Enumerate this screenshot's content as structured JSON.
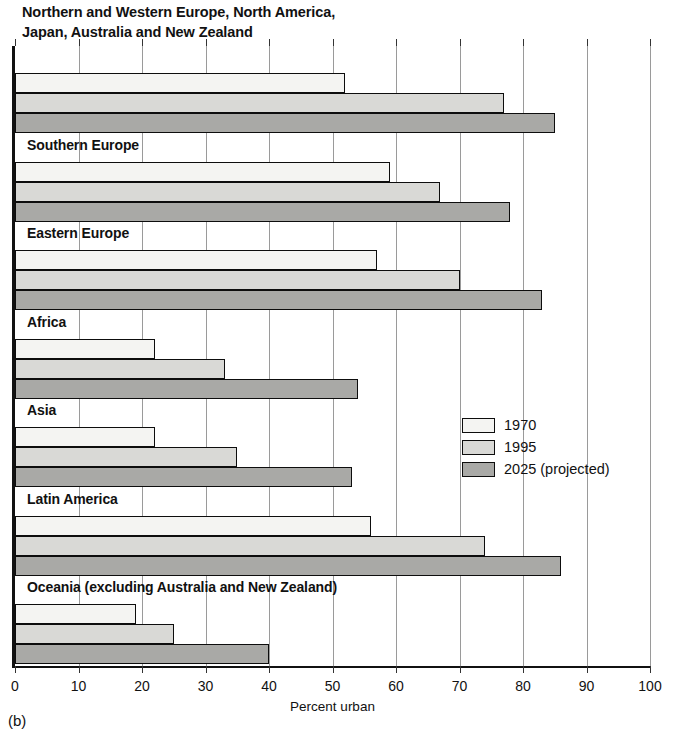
{
  "chart_data": {
    "type": "bar",
    "orientation": "horizontal",
    "title": "Northern and Western Europe, North America,\n Japan, Australia and New Zealand",
    "xlabel": "Percent urban",
    "ylabel": "",
    "xlim": [
      0,
      100
    ],
    "xticks": [
      0,
      10,
      20,
      30,
      40,
      50,
      60,
      70,
      80,
      90,
      100
    ],
    "grid": true,
    "legend_position": "middle-right",
    "categories": [
      "Northern and Western Europe, North America, Japan, Australia and New Zealand",
      "Southern Europe",
      "Eastern Europe",
      "Africa",
      "Asia",
      "Latin America",
      "Oceania (excluding Australia and New Zealand)"
    ],
    "series": [
      {
        "name": "1970",
        "color": "#f4f4f2",
        "values": [
          52,
          59,
          57,
          22,
          22,
          56,
          19
        ]
      },
      {
        "name": "1995",
        "color": "#d9d9d6",
        "values": [
          77,
          67,
          70,
          33,
          35,
          74,
          25
        ]
      },
      {
        "name": "2025 (projected)",
        "color": "#a9a9a6",
        "values": [
          85,
          78,
          83,
          54,
          53,
          86,
          40
        ]
      }
    ]
  },
  "groups": [
    {
      "label": "Northern and Western Europe, North America,\n Japan, Australia and New Zealand",
      "label_in_plot": false,
      "bars": [
        52,
        77,
        85
      ]
    },
    {
      "label": "Southern Europe",
      "label_in_plot": true,
      "bars": [
        59,
        67,
        78
      ]
    },
    {
      "label": "Eastern Europe",
      "label_in_plot": true,
      "bars": [
        57,
        70,
        83
      ]
    },
    {
      "label": "Africa",
      "label_in_plot": true,
      "bars": [
        22,
        33,
        54
      ]
    },
    {
      "label": "Asia",
      "label_in_plot": true,
      "bars": [
        22,
        35,
        53
      ]
    },
    {
      "label": "Latin America",
      "label_in_plot": true,
      "bars": [
        56,
        74,
        86
      ]
    },
    {
      "label": "Oceania (excluding Australia and New Zealand)",
      "label_in_plot": true,
      "bars": [
        19,
        25,
        40
      ]
    }
  ],
  "axis": {
    "tick_labels": [
      "0",
      "10",
      "20",
      "30",
      "40",
      "50",
      "60",
      "70",
      "80",
      "90",
      "100"
    ],
    "title": "Percent urban"
  },
  "legend": {
    "items": [
      {
        "label": "1970",
        "series": "s1970"
      },
      {
        "label": "1995",
        "series": "s1995"
      },
      {
        "label": "2025 (projected)",
        "series": "s2025"
      }
    ]
  },
  "caption": "(b)"
}
